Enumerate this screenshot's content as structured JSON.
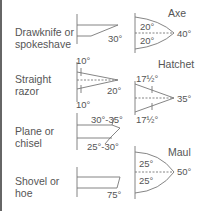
{
  "tools_left": [
    {
      "name": "Drawknife or\nspokeshave",
      "angles": {
        "bevel": "30°"
      }
    },
    {
      "name": "Straight\nrazor",
      "angles": {
        "top": "10°",
        "bottom": "10°",
        "total": "20°"
      }
    },
    {
      "name": "Plane or\nchisel",
      "angles": {
        "top": "30°-35°",
        "bottom": "25°-30°"
      }
    },
    {
      "name": "Shovel or\nhoe",
      "angles": {
        "bevel": "75°"
      }
    }
  ],
  "tools_right": [
    {
      "name": "Axe",
      "angles": {
        "top": "20°",
        "bottom": "20°",
        "total": "40°"
      }
    },
    {
      "name": "Hatchet",
      "angles": {
        "top": "17½°",
        "bottom": "17½°",
        "total": "35°"
      }
    },
    {
      "name": "Maul",
      "angles": {
        "top": "25°",
        "bottom": "25°",
        "total": "50°"
      }
    }
  ],
  "colors": {
    "line": "#777777",
    "text": "#555555",
    "frame": "#666666"
  }
}
